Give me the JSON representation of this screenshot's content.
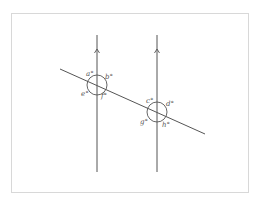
{
  "diagram": {
    "type": "parallel-lines-transversal",
    "colors": {
      "line": "#555555",
      "frame": "#d8d8d8",
      "label": "#555555"
    },
    "parallel_lines": [
      {
        "id": "left",
        "x": 97,
        "y1": 35,
        "y2": 172,
        "arrow_y": 50
      },
      {
        "id": "right",
        "x": 157,
        "y1": 35,
        "y2": 172,
        "arrow_y": 50
      }
    ],
    "transversal": {
      "x1": 60,
      "y1": 69,
      "x2": 205,
      "y2": 134
    },
    "intersections": [
      {
        "id": "left",
        "cx": 97,
        "cy": 85,
        "r": 10
      },
      {
        "id": "right",
        "cx": 157,
        "cy": 112,
        "r": 10
      }
    ],
    "angle_labels": {
      "a": "a°",
      "b": "b°",
      "e": "e°",
      "f": "f°",
      "c": "c°",
      "d": "d°",
      "g": "g°",
      "h": "h°"
    }
  }
}
